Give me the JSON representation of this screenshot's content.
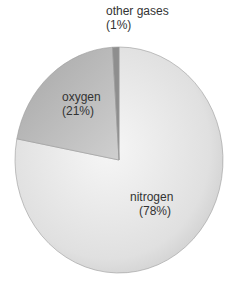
{
  "chart_data": {
    "type": "pie",
    "title": "",
    "slices": [
      {
        "label": "nitrogen",
        "percent_label": "(78%)",
        "value": 78,
        "color": "#e2e2e2"
      },
      {
        "label": "oxygen",
        "percent_label": "(21%)",
        "value": 21,
        "color": "#b4b4b4"
      },
      {
        "label": "other gases",
        "percent_label": "(1%)",
        "value": 1,
        "color": "#8a8a8a"
      }
    ],
    "legend": "none (inline labels)"
  },
  "labels": {
    "other": {
      "name": "other gases",
      "pct": "(1%)"
    },
    "oxygen": {
      "name": "oxygen",
      "pct": "(21%)"
    },
    "nitrogen": {
      "name": "nitrogen",
      "pct": "(78%)"
    }
  }
}
